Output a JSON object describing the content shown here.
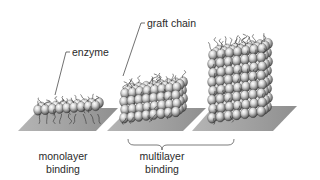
{
  "figure": {
    "type": "schematic illustration",
    "colors": {
      "background": "#ffffff",
      "substrate": "#9e9e9e",
      "sphere_light": "#f2f2f2",
      "sphere_mid": "#a8a8a8",
      "sphere_dark": "#3a3a3a",
      "chain": "#333333",
      "text": "#2a2a2a"
    }
  },
  "callouts": {
    "enzyme": "enzyme",
    "graft_chain": "graft chain"
  },
  "captions": {
    "monolayer": {
      "line1": "monolayer",
      "line2": "binding"
    },
    "multilayer": {
      "line1": "multilayer",
      "line2": "binding"
    }
  },
  "panels": [
    {
      "name": "monolayer",
      "rows": 2,
      "cols": 9
    },
    {
      "name": "multilayer-short",
      "rows": 4,
      "cols": 8
    },
    {
      "name": "multilayer-tall",
      "rows": 8,
      "cols": 7
    }
  ]
}
